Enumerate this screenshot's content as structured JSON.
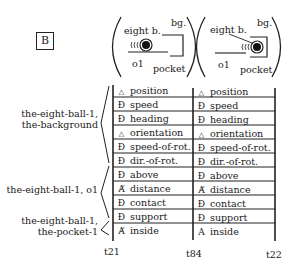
{
  "panel_label": "B",
  "scenes": [
    {
      "eight": "eight b.",
      "bg": "bg.",
      "o1": "o1",
      "pocket": "pocket"
    },
    {
      "eight": "eight b.",
      "bg": "bg.",
      "o1": "o1",
      "pocket": "pocket"
    }
  ],
  "groups": [
    {
      "label_line1": "the-eight-ball-1,",
      "label_line2": "the-background"
    },
    {
      "label_line1": "the-eight-ball-1, o1",
      "label_line2": ""
    },
    {
      "label_line1": "the-eight-ball-1,",
      "label_line2": "the-pocket-1"
    }
  ],
  "icons": {
    "triangle": "△",
    "D_slash": "Ɖ",
    "A_slash": "Ⱥ",
    "A": "A"
  },
  "columns": [
    {
      "rows": [
        {
          "icon": "△",
          "label": "position"
        },
        {
          "icon": "Ɖ",
          "label": "speed"
        },
        {
          "icon": "Ɖ",
          "label": "heading"
        },
        {
          "icon": "△",
          "label": "orientation"
        },
        {
          "icon": "Ɖ",
          "label": "speed-of-rot."
        },
        {
          "icon": "Ɖ",
          "label": "dir.-of-rot."
        },
        {
          "icon": "Ɖ",
          "label": "above"
        },
        {
          "icon": "Ⱥ",
          "label": "distance"
        },
        {
          "icon": "Ɖ",
          "label": "contact"
        },
        {
          "icon": "Ɖ",
          "label": "support"
        },
        {
          "icon": "Ⱥ",
          "label": "inside"
        }
      ]
    },
    {
      "rows": [
        {
          "icon": "△",
          "label": "position"
        },
        {
          "icon": "Ɖ",
          "label": "speed"
        },
        {
          "icon": "Ɖ",
          "label": "heading"
        },
        {
          "icon": "△",
          "label": "orientation"
        },
        {
          "icon": "Ɖ",
          "label": "speed-of-rot."
        },
        {
          "icon": "Ɖ",
          "label": "dir.-of-rot."
        },
        {
          "icon": "Ɖ",
          "label": "above"
        },
        {
          "icon": "Ⱥ",
          "label": "distance"
        },
        {
          "icon": "Ɖ",
          "label": "contact"
        },
        {
          "icon": "Ɖ",
          "label": "support"
        },
        {
          "icon": "A",
          "label": "inside"
        }
      ]
    }
  ],
  "time_ticks": [
    "t21",
    "t84",
    "t22"
  ]
}
